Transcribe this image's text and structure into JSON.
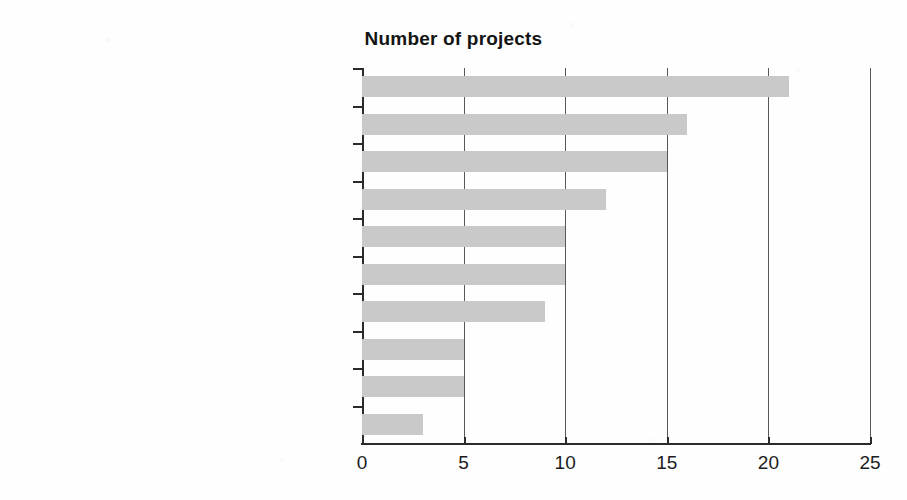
{
  "chart_data": {
    "type": "bar",
    "orientation": "horizontal",
    "title": "Number of projects",
    "xlabel": "",
    "ylabel": "",
    "xlim": [
      0,
      25
    ],
    "xticks": [
      0,
      5,
      10,
      15,
      20,
      25
    ],
    "xtick_labels": [
      "0",
      "5",
      "10",
      "15",
      "20",
      "25"
    ],
    "grid": "vertical",
    "legend": "none",
    "bar_color": "#c9c9c9",
    "axis_color": "#2b2b2b",
    "categories": [
      "Crop or enterprise yields",
      "Gender and equity",
      "Incomes, poverty and food security",
      "Water allocation access",
      "Economic returns and profitability",
      "Ecosystem services and environment",
      "Risk",
      "Conflict management",
      "Sustainability and resilience",
      "Human health"
    ],
    "values": [
      21,
      16,
      15,
      12,
      10,
      10,
      9,
      5,
      5,
      3
    ]
  }
}
